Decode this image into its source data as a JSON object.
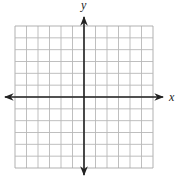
{
  "diagram": {
    "type": "coordinate-plane",
    "x_axis_label": "x",
    "y_axis_label": "y",
    "grid": {
      "columns": 12,
      "rows": 12,
      "left": 15,
      "top": 26,
      "right": 153,
      "bottom": 168,
      "line_color": "#b8b8b8",
      "border_color": "#a8a8a8"
    },
    "axes": {
      "origin_x": 84,
      "origin_y": 97,
      "x_start": 5,
      "x_end": 163,
      "y_start": 17,
      "y_end": 175,
      "color": "#222222",
      "arrows": "both-ends"
    },
    "labels": {
      "x_pos": [
        169,
        101
      ],
      "y_pos": [
        81,
        9
      ]
    }
  }
}
